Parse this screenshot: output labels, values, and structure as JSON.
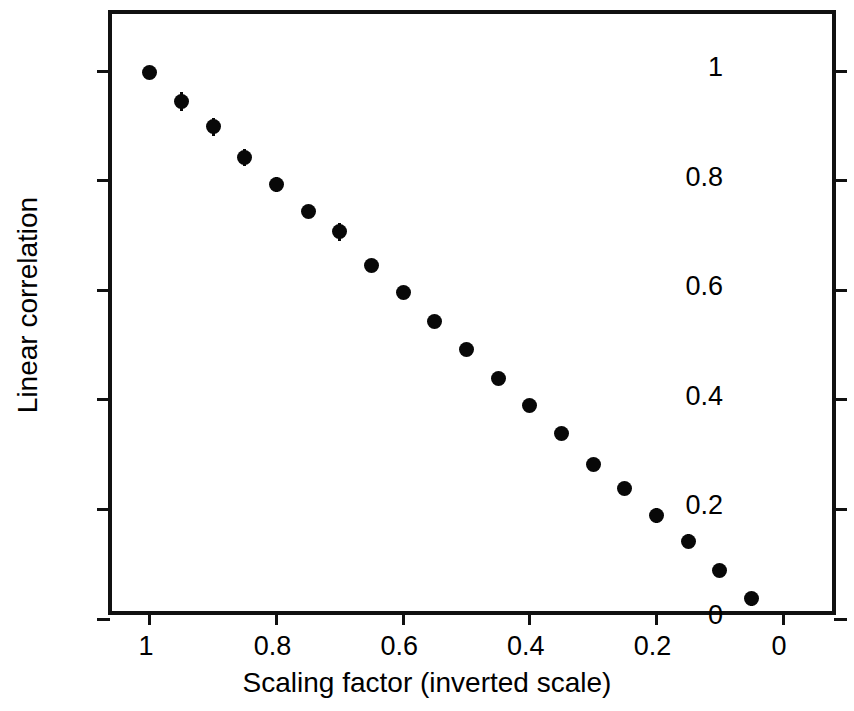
{
  "chart_data": {
    "type": "scatter",
    "title": "",
    "xlabel": "Scaling factor (inverted scale)",
    "ylabel": "Linear correlation",
    "xlim": [
      1.06,
      -0.09
    ],
    "ylim": [
      0.0,
      1.105
    ],
    "x_inverted": true,
    "grid": false,
    "legend": null,
    "xticks": [
      1,
      0.8,
      0.6,
      0.4,
      0.2,
      0
    ],
    "xticklabels": [
      "1",
      "0.8",
      "0.6",
      "0.4",
      "0.2",
      "0"
    ],
    "yticks": [
      0,
      0.2,
      0.4,
      0.6,
      0.8,
      1
    ],
    "yticklabels": [
      "0",
      "0.2",
      "0.4",
      "0.6",
      "0.8",
      "1"
    ],
    "marker": "filled-circle",
    "marker_color": "#080808",
    "errorbars": true,
    "x": [
      1.0,
      0.95,
      0.9,
      0.85,
      0.8,
      0.75,
      0.7,
      0.65,
      0.6,
      0.55,
      0.5,
      0.45,
      0.4,
      0.35,
      0.3,
      0.25,
      0.2,
      0.15,
      0.1,
      0.05
    ],
    "y": [
      0.999,
      0.945,
      0.899,
      0.843,
      0.793,
      0.745,
      0.707,
      0.646,
      0.596,
      0.543,
      0.493,
      0.44,
      0.39,
      0.339,
      0.283,
      0.239,
      0.189,
      0.142,
      0.089,
      0.037
    ],
    "yerr": [
      0.0,
      0.018,
      0.016,
      0.015,
      0.014,
      0.0,
      0.017,
      0.0,
      0.0,
      0.0,
      0.0,
      0.0,
      0.0,
      0.0,
      0.0,
      0.0,
      0.014,
      0.013,
      0.0,
      0.013
    ]
  },
  "axes": {
    "x_title": "Scaling factor (inverted scale)",
    "y_title": "Linear correlation"
  }
}
